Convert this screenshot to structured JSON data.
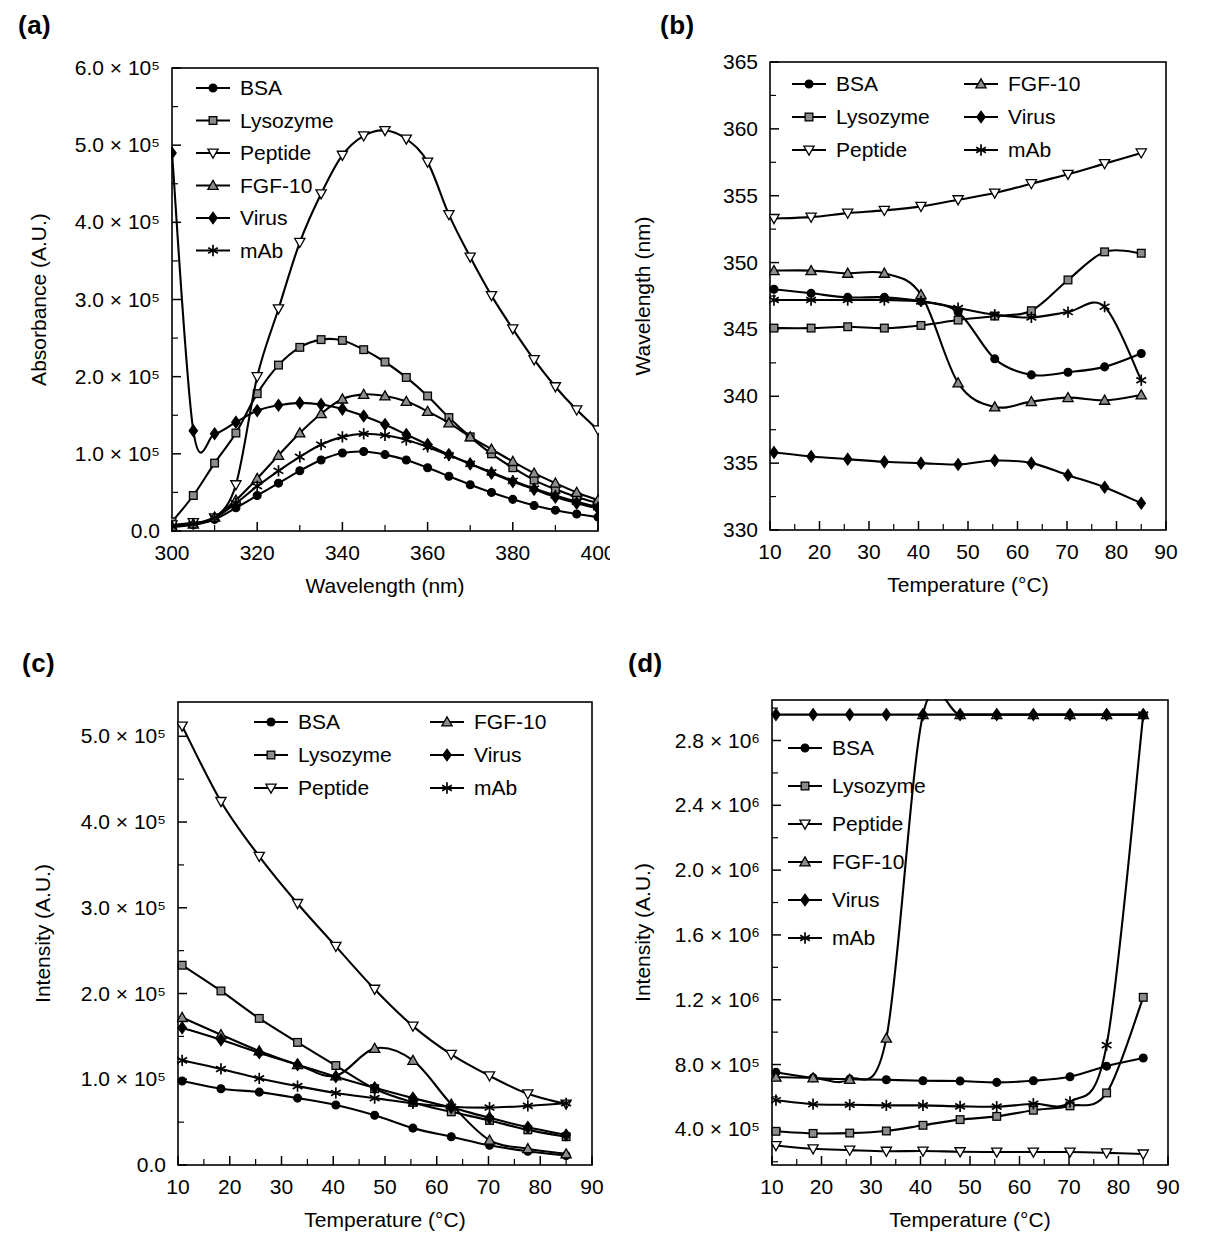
{
  "figure": {
    "panels": [
      "a",
      "b",
      "c",
      "d"
    ],
    "series_names": [
      "BSA",
      "Lysozyme",
      "Peptide",
      "FGF-10",
      "Virus",
      "mAb"
    ],
    "marker_styles": {
      "BSA": "filled-circle",
      "Lysozyme": "gray-square",
      "Peptide": "open-down-triangle",
      "FGF-10": "gray-up-triangle",
      "Virus": "filled-diamond",
      "mAb": "black-asterisk"
    },
    "line_color": "#000000",
    "marker_gray": "#8c8c8c",
    "background": "#ffffff"
  },
  "panel_a": {
    "label": "(a)",
    "legend_position": "top-left",
    "legend_columns": 1,
    "legend": [
      "BSA",
      "Lysozyme",
      "Peptide",
      "FGF-10",
      "Virus",
      "mAb"
    ],
    "chart_data": {
      "type": "line",
      "title": "",
      "xlabel": "Wavelength (nm)",
      "ylabel": "Absorbance (A.U.)",
      "xlim": [
        300,
        400
      ],
      "ylim": [
        0,
        600000
      ],
      "xticks": [
        300,
        320,
        340,
        360,
        380,
        400
      ],
      "xtick_labels": [
        "300",
        "320",
        "340",
        "360",
        "380",
        "400"
      ],
      "yticks": [
        0,
        100000,
        200000,
        300000,
        400000,
        500000,
        600000
      ],
      "ytick_labels": [
        "0.0",
        "1.0 × 10⁵",
        "2.0 × 10⁵",
        "3.0 × 10⁵",
        "4.0 × 10⁵",
        "5.0 × 10⁵",
        "6.0 × 10⁵"
      ],
      "grid": false,
      "x": [
        300,
        305,
        310,
        315,
        320,
        325,
        330,
        335,
        340,
        345,
        350,
        355,
        360,
        365,
        370,
        375,
        380,
        385,
        390,
        395,
        400
      ],
      "series": [
        {
          "name": "BSA",
          "values": [
            5000,
            8000,
            15000,
            30000,
            46000,
            62000,
            78000,
            92000,
            101000,
            103000,
            99000,
            92000,
            82000,
            71000,
            60000,
            50000,
            41000,
            33000,
            27000,
            22000,
            18000
          ]
        },
        {
          "name": "Lysozyme",
          "values": [
            12000,
            46000,
            88000,
            127000,
            178000,
            215000,
            238000,
            248000,
            247000,
            235000,
            219000,
            199000,
            175000,
            147000,
            122000,
            100000,
            82000,
            66000,
            54000,
            44000,
            36000
          ]
        },
        {
          "name": "Peptide",
          "values": [
            8000,
            11000,
            17000,
            60000,
            200000,
            288000,
            374000,
            437000,
            487000,
            512000,
            519000,
            508000,
            478000,
            410000,
            355000,
            305000,
            262000,
            222000,
            187000,
            157000,
            131000
          ]
        },
        {
          "name": "FGF-10",
          "values": [
            6000,
            9000,
            18000,
            40000,
            68000,
            98000,
            127000,
            152000,
            171000,
            177000,
            175000,
            168000,
            155000,
            140000,
            122000,
            106000,
            90000,
            75000,
            62000,
            50000,
            40000
          ]
        },
        {
          "name": "Virus",
          "values": [
            490000,
            130000,
            126000,
            141000,
            156000,
            163000,
            166000,
            164000,
            158000,
            149000,
            138000,
            125000,
            112000,
            99000,
            87000,
            75000,
            64000,
            54000,
            44000,
            36000,
            29000
          ]
        },
        {
          "name": "mAb",
          "values": [
            6000,
            9000,
            17000,
            36000,
            58000,
            78000,
            96000,
            112000,
            122000,
            126000,
            124000,
            118000,
            109000,
            98000,
            87000,
            76000,
            65000,
            55000,
            46000,
            38000,
            31000
          ]
        }
      ]
    }
  },
  "panel_b": {
    "label": "(b)",
    "legend_position": "top-left",
    "legend_columns": 2,
    "legend": [
      "BSA",
      "FGF-10",
      "Lysozyme",
      "Virus",
      "Peptide",
      "mAb"
    ],
    "chart_data": {
      "type": "line",
      "title": "",
      "xlabel": "Temperature (°C)",
      "ylabel": "Wavelength (nm)",
      "xlim": [
        10,
        90
      ],
      "ylim": [
        330,
        365
      ],
      "xticks": [
        10,
        20,
        30,
        40,
        50,
        60,
        70,
        80,
        90
      ],
      "xtick_labels": [
        "10",
        "20",
        "30",
        "40",
        "50",
        "60",
        "70",
        "80",
        "90"
      ],
      "yticks": [
        330,
        335,
        340,
        345,
        350,
        355,
        360,
        365
      ],
      "ytick_labels": [
        "330",
        "335",
        "340",
        "345",
        "350",
        "355",
        "360",
        "365"
      ],
      "grid": false,
      "x": [
        10.8,
        18.3,
        25.7,
        33.1,
        40.5,
        48.0,
        55.4,
        62.8,
        70.2,
        77.6,
        85.0
      ],
      "series": [
        {
          "name": "BSA",
          "values": [
            348.0,
            347.7,
            347.4,
            347.4,
            347.1,
            346.3,
            342.8,
            341.6,
            341.8,
            342.2,
            343.2
          ]
        },
        {
          "name": "Lysozyme",
          "values": [
            345.1,
            345.1,
            345.2,
            345.1,
            345.3,
            345.7,
            346.0,
            346.4,
            348.7,
            350.8,
            350.7
          ]
        },
        {
          "name": "Peptide",
          "values": [
            353.3,
            353.4,
            353.7,
            353.9,
            354.2,
            354.7,
            355.2,
            355.9,
            356.6,
            357.4,
            358.2
          ]
        },
        {
          "name": "FGF-10",
          "values": [
            349.4,
            349.4,
            349.2,
            349.2,
            347.6,
            341.0,
            339.2,
            339.6,
            339.9,
            339.7,
            340.1
          ]
        },
        {
          "name": "Virus",
          "values": [
            335.8,
            335.5,
            335.3,
            335.1,
            335.0,
            334.9,
            335.2,
            335.0,
            334.1,
            333.2,
            332.0
          ]
        },
        {
          "name": "mAb",
          "values": [
            347.2,
            347.2,
            347.2,
            347.2,
            347.1,
            346.6,
            346.1,
            345.9,
            346.3,
            346.7,
            341.2
          ]
        }
      ]
    }
  },
  "panel_c": {
    "label": "(c)",
    "legend_position": "top-right",
    "legend_columns": 2,
    "legend": [
      "BSA",
      "FGF-10",
      "Lysozyme",
      "Virus",
      "Peptide",
      "mAb"
    ],
    "chart_data": {
      "type": "line",
      "title": "",
      "xlabel": "Temperature (°C)",
      "ylabel": "Intensity (A.U.)",
      "xlim": [
        10,
        90
      ],
      "ylim": [
        0,
        540000
      ],
      "xticks": [
        10,
        20,
        30,
        40,
        50,
        60,
        70,
        80,
        90
      ],
      "xtick_labels": [
        "10",
        "20",
        "30",
        "40",
        "50",
        "60",
        "70",
        "80",
        "90"
      ],
      "yticks": [
        0,
        100000,
        200000,
        300000,
        400000,
        500000
      ],
      "ytick_labels": [
        "0.0",
        "1.0 × 10⁵",
        "2.0 × 10⁵",
        "3.0 × 10⁵",
        "4.0 × 10⁵",
        "5.0 × 10⁵"
      ],
      "grid": false,
      "x": [
        10.8,
        18.3,
        25.7,
        33.1,
        40.5,
        48.0,
        55.4,
        62.8,
        70.2,
        77.6,
        85.0
      ],
      "series": [
        {
          "name": "BSA",
          "values": [
            98000,
            89000,
            85000,
            78000,
            70000,
            58000,
            43000,
            33000,
            23000,
            16000,
            11000
          ]
        },
        {
          "name": "Lysozyme",
          "values": [
            233000,
            203000,
            171000,
            143000,
            116000,
            89000,
            73000,
            62000,
            52000,
            41000,
            33000
          ]
        },
        {
          "name": "Peptide",
          "values": [
            512000,
            424000,
            360000,
            305000,
            255000,
            205000,
            162000,
            129000,
            104000,
            83000,
            71000
          ]
        },
        {
          "name": "FGF-10",
          "values": [
            172000,
            152000,
            133000,
            117000,
            104000,
            136000,
            122000,
            71000,
            29000,
            19000,
            13000
          ]
        },
        {
          "name": "Virus",
          "values": [
            160000,
            146000,
            131000,
            117000,
            103000,
            90000,
            78000,
            67000,
            55000,
            44000,
            35000
          ]
        },
        {
          "name": "mAb",
          "values": [
            122000,
            112000,
            101000,
            92000,
            84000,
            78000,
            72000,
            68000,
            67000,
            69000,
            72000
          ]
        }
      ]
    }
  },
  "panel_d": {
    "label": "(d)",
    "legend_position": "left-middle",
    "legend_columns": 1,
    "legend": [
      "BSA",
      "Lysozyme",
      "Peptide",
      "FGF-10",
      "Virus",
      "mAb"
    ],
    "chart_data": {
      "type": "line",
      "title": "",
      "xlabel": "Temperature (°C)",
      "ylabel": "Intensity (A.U.)",
      "xlim": [
        10,
        90
      ],
      "ylim": [
        180000,
        3050000
      ],
      "xticks": [
        10,
        20,
        30,
        40,
        50,
        60,
        70,
        80,
        90
      ],
      "xtick_labels": [
        "10",
        "20",
        "30",
        "40",
        "50",
        "60",
        "70",
        "80",
        "90"
      ],
      "yticks": [
        400000,
        800000,
        1200000,
        1600000,
        2000000,
        2400000,
        2800000
      ],
      "ytick_labels": [
        "4.0 × 10⁵",
        "8.0 × 10⁵",
        "1.2 × 10⁶",
        "1.6 × 10⁶",
        "2.0 × 10⁶",
        "2.4 × 10⁶",
        "2.8 × 10⁶"
      ],
      "grid": false,
      "x": [
        10.8,
        18.3,
        25.7,
        33.1,
        40.5,
        48.0,
        55.4,
        62.8,
        70.2,
        77.6,
        85.0
      ],
      "series": [
        {
          "name": "BSA",
          "values": [
            752000,
            718000,
            710000,
            706000,
            700000,
            698000,
            690000,
            700000,
            725000,
            790000,
            840000
          ]
        },
        {
          "name": "Lysozyme",
          "values": [
            388000,
            375000,
            377000,
            390000,
            425000,
            460000,
            480000,
            518000,
            545000,
            625000,
            1215000
          ]
        },
        {
          "name": "Peptide",
          "values": [
            300000,
            280000,
            272000,
            265000,
            266000,
            262000,
            260000,
            260000,
            260000,
            255000,
            248000
          ]
        },
        {
          "name": "FGF-10",
          "values": [
            722000,
            718000,
            708000,
            963000,
            2960000,
            2960000,
            2960000,
            2960000,
            2960000,
            2960000,
            2960000
          ]
        },
        {
          "name": "Virus",
          "values": [
            2960000,
            2960000,
            2960000,
            2960000,
            2960000,
            2960000,
            2960000,
            2960000,
            2960000,
            2960000,
            2960000
          ]
        },
        {
          "name": "mAb",
          "values": [
            580000,
            555000,
            552000,
            548000,
            548000,
            542000,
            540000,
            558000,
            570000,
            920000,
            2960000
          ]
        }
      ]
    }
  }
}
